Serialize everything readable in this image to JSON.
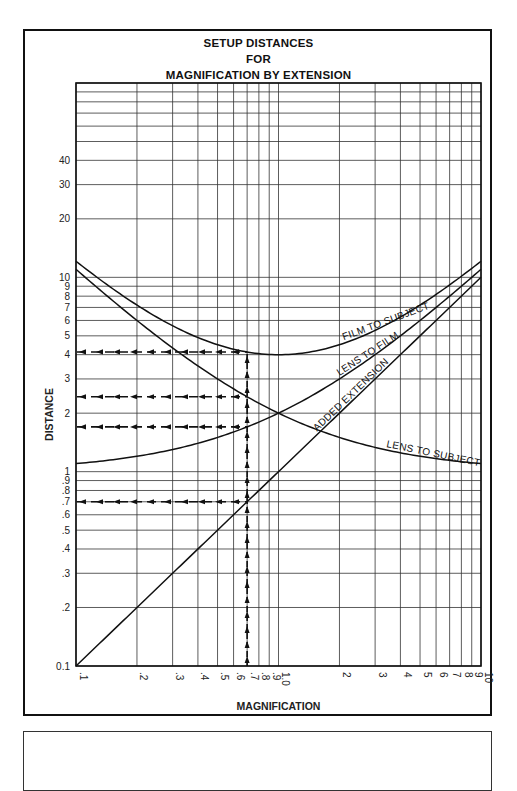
{
  "chart_data": {
    "type": "line",
    "title_lines": [
      "SETUP DISTANCES",
      "FOR",
      "MAGNIFICATION BY EXTENSION"
    ],
    "xlabel": "MAGNIFICATION",
    "ylabel": "DISTANCE",
    "xscale": "log",
    "yscale": "log",
    "xlim": [
      0.1,
      10
    ],
    "ylim": [
      0.1,
      100
    ],
    "grid": true,
    "x_ticks": [
      {
        "v": 0.1,
        "label": ".1"
      },
      {
        "v": 0.2,
        "label": ".2"
      },
      {
        "v": 0.3,
        "label": ".3"
      },
      {
        "v": 0.4,
        "label": ".4"
      },
      {
        "v": 0.5,
        "label": ".5"
      },
      {
        "v": 0.6,
        "label": ".6"
      },
      {
        "v": 0.7,
        "label": ".7"
      },
      {
        "v": 0.8,
        "label": ".8"
      },
      {
        "v": 0.9,
        "label": ".9"
      },
      {
        "v": 1.0,
        "label": "1.0"
      },
      {
        "v": 2,
        "label": "2"
      },
      {
        "v": 3,
        "label": "3"
      },
      {
        "v": 4,
        "label": "4"
      },
      {
        "v": 5,
        "label": "5"
      },
      {
        "v": 6,
        "label": "6"
      },
      {
        "v": 7,
        "label": "7"
      },
      {
        "v": 8,
        "label": "8"
      },
      {
        "v": 9,
        "label": "9"
      },
      {
        "v": 10,
        "label": "10"
      }
    ],
    "y_ticks": [
      {
        "v": 0.1,
        "label": "0.1"
      },
      {
        "v": 0.2,
        "label": ".2"
      },
      {
        "v": 0.3,
        "label": ".3"
      },
      {
        "v": 0.4,
        "label": ".4"
      },
      {
        "v": 0.5,
        "label": ".5"
      },
      {
        "v": 0.6,
        "label": ".6"
      },
      {
        "v": 0.7,
        "label": ".7"
      },
      {
        "v": 0.8,
        "label": ".8"
      },
      {
        "v": 0.9,
        "label": ".9"
      },
      {
        "v": 1,
        "label": "1"
      },
      {
        "v": 2,
        "label": "2"
      },
      {
        "v": 3,
        "label": "3"
      },
      {
        "v": 4,
        "label": "4"
      },
      {
        "v": 5,
        "label": "5"
      },
      {
        "v": 6,
        "label": "6"
      },
      {
        "v": 7,
        "label": "7"
      },
      {
        "v": 8,
        "label": "8"
      },
      {
        "v": 9,
        "label": "9"
      },
      {
        "v": 10,
        "label": "10"
      },
      {
        "v": 20,
        "label": "20"
      },
      {
        "v": 30,
        "label": "30"
      },
      {
        "v": 40,
        "label": "40"
      },
      {
        "v": 50,
        "label": ""
      },
      {
        "v": 60,
        "label": ""
      },
      {
        "v": 70,
        "label": ""
      },
      {
        "v": 80,
        "label": ""
      },
      {
        "v": 90,
        "label": ""
      },
      {
        "v": 100,
        "label": ""
      }
    ],
    "series": [
      {
        "name": "FILM TO SUBJECT",
        "formula": "2 + m + 1/m",
        "x": [
          0.1,
          0.2,
          0.3,
          0.5,
          0.7,
          1.0,
          2,
          3,
          5,
          7,
          10
        ],
        "y": [
          12.1,
          7.2,
          5.63,
          4.5,
          4.13,
          4.0,
          4.5,
          5.33,
          7.2,
          9.14,
          12.1
        ]
      },
      {
        "name": "LENS TO SUBJECT",
        "formula": "1 + 1/m",
        "x": [
          0.1,
          0.2,
          0.3,
          0.5,
          0.7,
          1.0,
          2,
          3,
          5,
          7,
          10
        ],
        "y": [
          11,
          6,
          4.33,
          3,
          2.43,
          2,
          1.5,
          1.33,
          1.2,
          1.14,
          1.1
        ]
      },
      {
        "name": "LENS TO FILM",
        "formula": "1 + m",
        "x": [
          0.1,
          0.2,
          0.3,
          0.5,
          0.7,
          1.0,
          2,
          3,
          5,
          7,
          10
        ],
        "y": [
          1.1,
          1.2,
          1.3,
          1.5,
          1.7,
          2,
          3,
          4,
          6,
          8,
          11
        ]
      },
      {
        "name": "ADDED EXTENSION",
        "formula": "m",
        "x": [
          0.1,
          10
        ],
        "y": [
          0.1,
          10
        ]
      }
    ],
    "annotations": {
      "example_magnification": 0.7,
      "readouts": [
        {
          "series": "FILM TO SUBJECT",
          "value": 4.13
        },
        {
          "series": "LENS TO SUBJECT",
          "value": 2.43
        },
        {
          "series": "LENS TO FILM",
          "value": 1.7
        },
        {
          "series": "ADDED EXTENSION",
          "value": 0.7
        }
      ],
      "style": "dashed arrows"
    }
  }
}
